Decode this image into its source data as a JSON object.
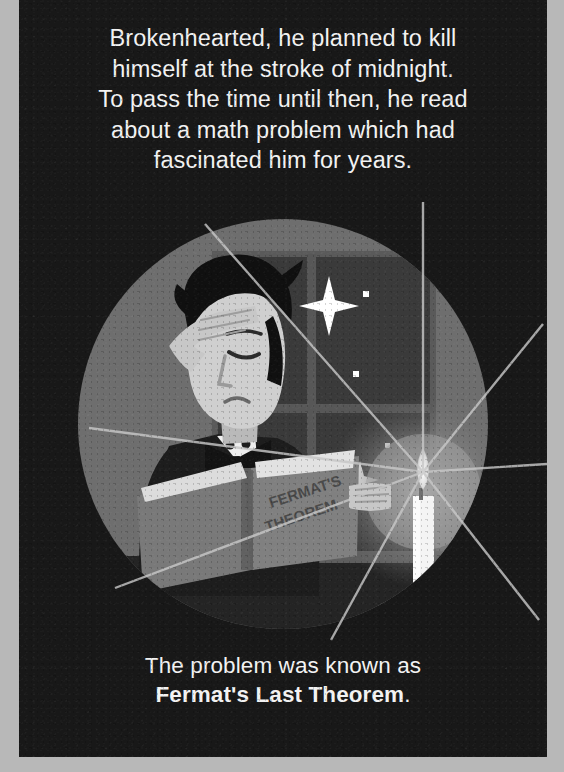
{
  "panel": {
    "background_color": "#181818",
    "page_margin_color": "#b8b8b8"
  },
  "top_caption": {
    "lines": [
      "Brokenhearted, he planned to kill",
      "himself at the stroke of midnight.",
      "To pass the time until then, he read",
      "about a math problem which had",
      "fascinated him for years."
    ]
  },
  "bottom_caption": {
    "line1": "The problem was known as",
    "line2_bold": "Fermat's Last Theorem",
    "line2_tail": "."
  },
  "illustration": {
    "name": "man-reading-by-candlelight",
    "book_title_line1": "FERMAT'S",
    "book_title_line2": "THEOREM",
    "colors": {
      "vignette_ring": "#6e6e6e",
      "window_pane": "#3a3a3a",
      "window_frame": "#555555",
      "book_cover": "#797979",
      "book_page": "#d6d6d6",
      "skin": "#cfcfcf",
      "hair": "#101010",
      "suit": "#1d1d1d",
      "shirt": "#f0f0f0",
      "candle_body": "#f4f4f4",
      "candle_glow": "#8a8a8a",
      "light_ray": "#c9c9c9",
      "star": "#ffffff"
    },
    "elements": [
      "circular-vignette",
      "window-with-mullions",
      "night-stars",
      "seated-man",
      "hand-on-forehead",
      "bow-tie",
      "open-book",
      "candle",
      "candle-holder",
      "light-rays"
    ],
    "star_count": 8,
    "ray_count": 8
  }
}
